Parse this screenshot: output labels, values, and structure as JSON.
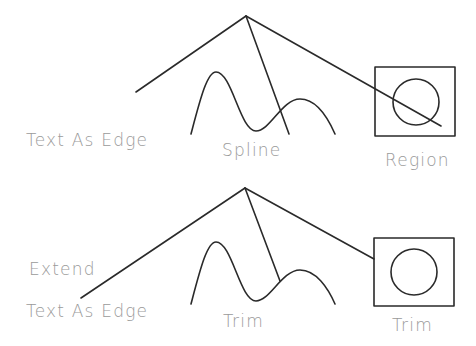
{
  "diagram": {
    "type": "cad-trim-extend-illustration",
    "colors": {
      "stroke": "#2a2a2a",
      "label": "#9a9a9a",
      "background": "#ffffff"
    },
    "top_section": {
      "labels": {
        "text_as_edge": "Text As Edge",
        "spline": "Spline",
        "region": "Region"
      },
      "vertex": [
        246,
        16
      ],
      "lines": [
        {
          "name": "left-edge",
          "from": [
            246,
            16
          ],
          "to": [
            136,
            92
          ]
        },
        {
          "name": "middle-edge",
          "from": [
            246,
            16
          ],
          "to": [
            289,
            134
          ]
        },
        {
          "name": "right-edge",
          "from": [
            246,
            16
          ],
          "to": [
            441,
            126
          ]
        }
      ],
      "spline_path": "M191,134 C200,100 207,72 216,72 C232,72 240,131 256,131 C270,131 282,99 300,99 C316,99 328,118 335,134",
      "region_box": {
        "x": 375,
        "y": 67,
        "w": 80,
        "h": 69
      },
      "region_circle": {
        "cx": 416,
        "cy": 102,
        "r": 23
      }
    },
    "bottom_section": {
      "labels": {
        "extend": "Extend",
        "text_as_edge": "Text As Edge",
        "trim_spline": "Trim",
        "trim_region": "Trim"
      },
      "vertex": [
        245,
        188
      ],
      "lines": [
        {
          "name": "left-edge-extended",
          "from": [
            245,
            188
          ],
          "to": [
            81,
            298
          ]
        },
        {
          "name": "middle-edge-trimmed",
          "from": [
            245,
            188
          ],
          "to": [
            280,
            281
          ]
        },
        {
          "name": "right-edge-trimmed",
          "from": [
            245,
            188
          ],
          "to": [
            374,
            259
          ]
        }
      ],
      "spline_path": "M191,304 C200,270 207,242 216,242 C232,242 240,301 256,301 C270,301 282,270 300,270 C316,270 328,288 335,304",
      "region_box": {
        "x": 374,
        "y": 238,
        "w": 80,
        "h": 68
      },
      "region_circle": {
        "cx": 414,
        "cy": 272,
        "r": 23
      }
    }
  }
}
